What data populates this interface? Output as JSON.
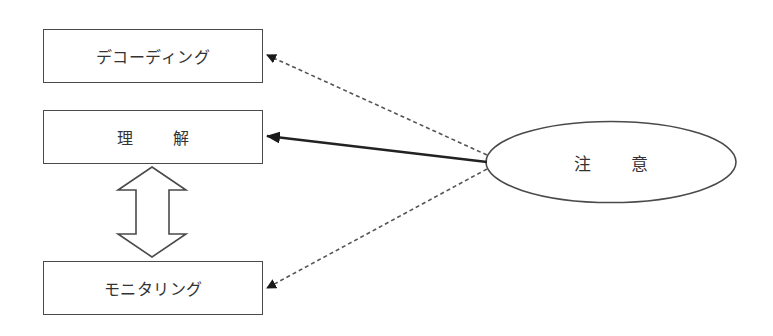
{
  "diagram": {
    "nodes": {
      "decoding": {
        "label": "デコーディング"
      },
      "comprehension": {
        "label_chars": [
          "理",
          "解"
        ],
        "label": "理 解"
      },
      "monitoring": {
        "label": "モニタリング"
      },
      "attention": {
        "label_chars": [
          "注",
          "意"
        ],
        "label": "注 意"
      }
    },
    "edges": [
      {
        "from": "attention",
        "to": "decoding",
        "style": "dashed"
      },
      {
        "from": "attention",
        "to": "comprehension",
        "style": "solid-bold"
      },
      {
        "from": "attention",
        "to": "monitoring",
        "style": "dashed"
      },
      {
        "from": "comprehension",
        "to": "monitoring",
        "style": "hollow-double-arrow"
      }
    ],
    "colors": {
      "stroke": "#4a4a4a",
      "text": "#333333",
      "arrow": "#1a1a1a",
      "background": "#ffffff"
    }
  }
}
